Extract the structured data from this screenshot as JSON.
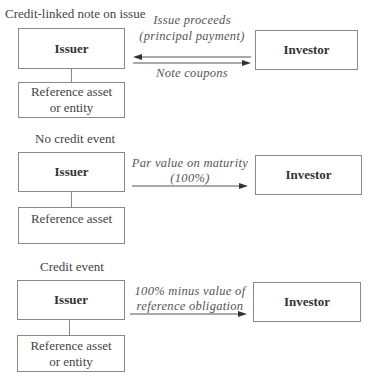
{
  "sections": [
    {
      "heading": "Credit-linked note on issue",
      "issuer_label": "Issuer",
      "reference_lines": [
        "Reference asset",
        "or entity"
      ],
      "investor_label": "Investor",
      "flows": [
        {
          "direction": "investor-to-issuer",
          "label_lines": [
            "Issue proceeds",
            "(principal payment)"
          ]
        },
        {
          "direction": "issuer-to-investor",
          "label_lines": [
            "Note coupons"
          ]
        }
      ]
    },
    {
      "heading": "No credit event",
      "issuer_label": "Issuer",
      "reference_lines": [
        "Reference asset"
      ],
      "investor_label": "Investor",
      "flows": [
        {
          "direction": "issuer-to-investor",
          "label_lines": [
            "Par value on maturity",
            "(100%)"
          ]
        }
      ]
    },
    {
      "heading": "Credit event",
      "issuer_label": "Issuer",
      "reference_lines": [
        "Reference asset",
        "or entity"
      ],
      "investor_label": "Investor",
      "flows": [
        {
          "direction": "issuer-to-investor",
          "label_lines": [
            "100% minus value of",
            "reference obligation"
          ]
        }
      ]
    }
  ],
  "colors": {
    "line": "#888888",
    "arrow": "#333333",
    "text": "#333333"
  }
}
